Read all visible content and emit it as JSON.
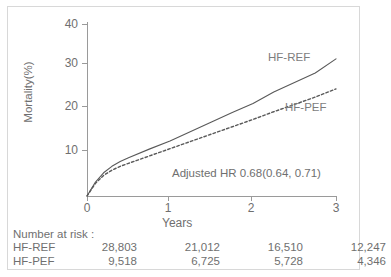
{
  "chart_data": {
    "type": "line",
    "title": "",
    "xlabel": "Years",
    "ylabel": "Mortality(%)",
    "xlim": [
      0,
      3
    ],
    "ylim": [
      0,
      40
    ],
    "xticks": [
      "0",
      "1",
      "2",
      "3"
    ],
    "yticks": [
      "10",
      "20",
      "30",
      "40"
    ],
    "grid": false,
    "legend_position": "inline-curve-labels",
    "annotations": [
      {
        "name": "adjusted-hazard-ratio",
        "text": "Adjusted HR 0.68(0.64, 0.71)"
      }
    ],
    "series": [
      {
        "name": "HF-REF",
        "style": "solid",
        "color": "#595959",
        "x": [
          0,
          0.1,
          0.2,
          0.3,
          0.4,
          0.5,
          0.75,
          1.0,
          1.25,
          1.5,
          1.75,
          2.0,
          2.25,
          2.5,
          2.75,
          3.0
        ],
        "values": [
          0,
          3.2,
          5.4,
          6.9,
          8.0,
          8.9,
          10.9,
          12.8,
          15.0,
          17.2,
          19.4,
          21.5,
          24.2,
          26.4,
          28.6,
          31.9
        ]
      },
      {
        "name": "HF-PEF",
        "style": "dashed",
        "color": "#595959",
        "x": [
          0,
          0.1,
          0.2,
          0.3,
          0.4,
          0.5,
          0.75,
          1.0,
          1.25,
          1.5,
          1.75,
          2.0,
          2.25,
          2.5,
          2.75,
          3.0
        ],
        "values": [
          0,
          2.9,
          4.8,
          6.0,
          6.9,
          7.6,
          9.3,
          11.0,
          12.7,
          14.4,
          16.1,
          17.8,
          19.6,
          21.3,
          23.0,
          24.9
        ]
      }
    ]
  },
  "risk_table": {
    "title": "Number at risk :",
    "rows": [
      {
        "label": "HF-REF",
        "values": [
          "28,803",
          "21,012",
          "16,510",
          "12,247"
        ]
      },
      {
        "label": "HF-PEF",
        "values": [
          "9,518",
          "6,725",
          "5,728",
          "4,346"
        ]
      }
    ]
  }
}
